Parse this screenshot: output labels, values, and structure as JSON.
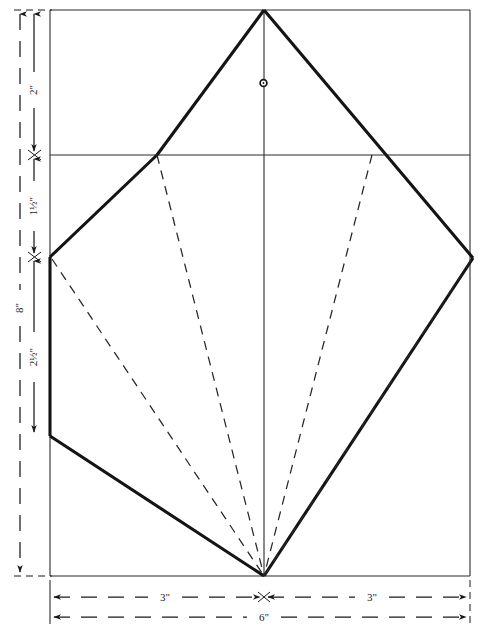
{
  "drawing": {
    "title": "Kite construction pattern",
    "units": "inches",
    "line_color": "#1a1a1a",
    "background_color": "#ffffff",
    "border": {
      "left": 50,
      "top": 10,
      "right": 470,
      "bottom": 576
    },
    "vertices": {
      "top_apex": {
        "x": 264,
        "y": 10
      },
      "upper_left_shoulder": {
        "x": 157,
        "y": 155
      },
      "upper_right_shoulder": {
        "x": 372,
        "y": 155
      },
      "left_vertex": {
        "x": 50,
        "y": 257
      },
      "left_lower_vertex": {
        "x": 50,
        "y": 436
      },
      "right_vertex": {
        "x": 473,
        "y": 258
      },
      "bottom_apex": {
        "x": 264,
        "y": 576
      }
    },
    "center_hole": {
      "x": 263,
      "y": 83,
      "radius": 3,
      "label": "spar-hole"
    },
    "spine": {
      "x": 264,
      "y1": 10,
      "y2": 576
    },
    "cross_spar": {
      "y": 155,
      "x1": 50,
      "x2": 470
    },
    "fold_lines": [
      {
        "from": {
          "x": 157,
          "y": 155
        },
        "to": {
          "x": 264,
          "y": 576
        }
      },
      {
        "from": {
          "x": 372,
          "y": 155
        },
        "to": {
          "x": 264,
          "y": 576
        }
      },
      {
        "from": {
          "x": 50,
          "y": 257
        },
        "to": {
          "x": 264,
          "y": 576
        }
      },
      {
        "from": {
          "x": 473,
          "y": 258
        },
        "to": {
          "x": 264,
          "y": 576
        }
      }
    ]
  },
  "dimensions": {
    "vertical": {
      "overall": {
        "label": "8\"",
        "from_y": 10,
        "to_y": 576,
        "x": 20
      },
      "segments": [
        {
          "label": "2\"",
          "from_y": 10,
          "to_y": 155,
          "x": 34
        },
        {
          "label": "1½\"",
          "from_y": 155,
          "to_y": 257,
          "x": 34
        },
        {
          "label": "2½\"",
          "from_y": 257,
          "to_y": 436,
          "x": 34
        }
      ]
    },
    "horizontal": {
      "segments": [
        {
          "label": "3\"",
          "from_x": 50,
          "to_x": 264,
          "y": 597
        },
        {
          "label": "3\"",
          "from_x": 264,
          "to_x": 470,
          "y": 597
        }
      ],
      "overall": {
        "label": "6\"",
        "from_x": 50,
        "to_x": 470,
        "y": 617
      }
    }
  }
}
